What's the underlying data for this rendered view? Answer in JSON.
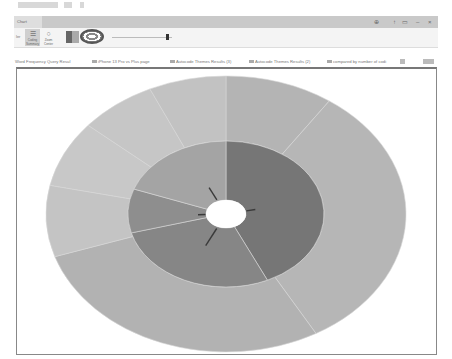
{
  "window": {
    "tab_label": "Chart",
    "ribbon_group_label": "ler",
    "controls": [
      "help-icon",
      "restore-icon",
      "ribbon-toggle-icon",
      "minimize-icon",
      "close-icon"
    ]
  },
  "ribbon": {
    "buttons": [
      {
        "label": "Coding Summary",
        "icon": "list-icon",
        "active": true
      },
      {
        "label": "Zoom Center",
        "icon": "circle-icon",
        "active": false
      }
    ],
    "color_swatch": "color-scheme-icon",
    "chart_type": "sunburst-icon",
    "slider": {
      "value_pct": 90
    }
  },
  "doc_tabs": [
    {
      "label": "Word Frequency Query Resul"
    },
    {
      "label": "iPhone 13 Pro vs Plus page"
    },
    {
      "label": "Autocode Themes Results (3)"
    },
    {
      "label": "Autocode Themes Results (2)"
    },
    {
      "label": "compared by number of codi"
    }
  ],
  "chart_data": {
    "type": "sunburst",
    "title": "",
    "rings": [
      {
        "name": "inner",
        "segments": [
          {
            "start_deg": 0,
            "end_deg": 155,
            "color": "#767676"
          },
          {
            "start_deg": 155,
            "end_deg": 255,
            "color": "#868686"
          },
          {
            "start_deg": 255,
            "end_deg": 290,
            "color": "#8e8e8e"
          },
          {
            "start_deg": 290,
            "end_deg": 360,
            "color": "#a4a4a4"
          }
        ]
      },
      {
        "name": "outer",
        "segments": [
          {
            "start_deg": 0,
            "end_deg": 35,
            "color": "#b4b4b4"
          },
          {
            "start_deg": 35,
            "end_deg": 150,
            "color": "#b6b6b6"
          },
          {
            "start_deg": 150,
            "end_deg": 252,
            "color": "#b2b2b2"
          },
          {
            "start_deg": 252,
            "end_deg": 282,
            "color": "#c4c4c4"
          },
          {
            "start_deg": 282,
            "end_deg": 310,
            "color": "#c8c8c8"
          },
          {
            "start_deg": 310,
            "end_deg": 335,
            "color": "#c6c6c6"
          },
          {
            "start_deg": 335,
            "end_deg": 360,
            "color": "#c2c2c2"
          }
        ]
      }
    ],
    "center": {
      "cx": 209,
      "cy": 145
    },
    "radii": {
      "hole": [
        20,
        14
      ],
      "inner": [
        98,
        73
      ],
      "outer": [
        180,
        138
      ]
    },
    "legend": "none",
    "grid": false
  }
}
